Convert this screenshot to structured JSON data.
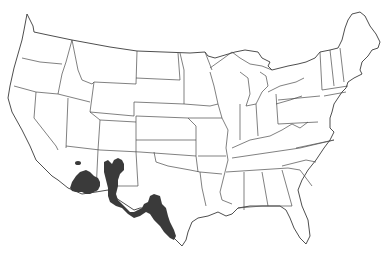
{
  "map": {
    "title": "",
    "region": "Contiguous United States",
    "type": "species range map",
    "range_color": "#3a3a3a",
    "border_color": "#4a4a4a",
    "background": "#ffffff",
    "range_areas": [
      {
        "name": "southern-arizona"
      },
      {
        "name": "southwest-new-mexico"
      },
      {
        "name": "west-texas-trans-pecos"
      },
      {
        "name": "central-south-texas"
      },
      {
        "name": "central-arizona-outlier"
      }
    ]
  }
}
